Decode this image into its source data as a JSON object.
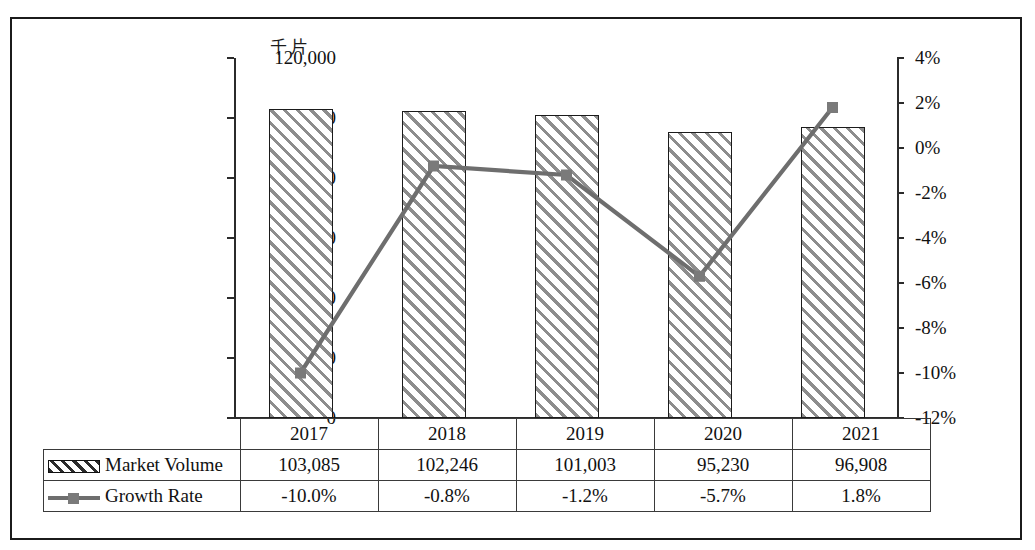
{
  "chart_data": {
    "type": "bar",
    "title": "",
    "subtitle": "",
    "unit_label": "千片",
    "categories": [
      "2017",
      "2018",
      "2019",
      "2020",
      "2021"
    ],
    "xlabel": "",
    "grid": false,
    "legend_position": "table-below",
    "series": [
      {
        "name": "Market Volume",
        "type": "bar",
        "axis": "left",
        "values": [
          103085,
          102246,
          101003,
          95230,
          96908
        ],
        "display_values": [
          "103,085",
          "102,246",
          "101,003",
          "95,230",
          "96,908"
        ],
        "swatch": "hatched-rectangle"
      },
      {
        "name": "Growth Rate",
        "type": "line",
        "axis": "right",
        "values": [
          -10.0,
          -0.8,
          -1.2,
          -5.7,
          1.8
        ],
        "display_values": [
          "-10.0%",
          "-0.8%",
          "-1.2%",
          "-5.7%",
          "1.8%"
        ],
        "swatch": "line-with-square-marker"
      }
    ],
    "left_axis": {
      "label": "",
      "ylim": [
        0,
        120000
      ],
      "tick_step": 20000,
      "ticks": [
        0,
        20000,
        40000,
        60000,
        80000,
        100000,
        120000
      ],
      "tick_labels": [
        "0",
        "20,000",
        "40,000",
        "60,000",
        "80,000",
        "100,000",
        "120,000"
      ]
    },
    "right_axis": {
      "label": "",
      "ylim": [
        -12,
        4
      ],
      "tick_step": 2,
      "ticks": [
        -12,
        -10,
        -8,
        -6,
        -4,
        -2,
        0,
        2,
        4
      ],
      "tick_labels": [
        "-12%",
        "-10%",
        "-8%",
        "-6%",
        "-4%",
        "-2%",
        "0%",
        "2%",
        "4%"
      ]
    },
    "colors": {
      "bar_outline": "#1b1b1b",
      "bar_hatch": "#8d8d8d",
      "line": "#6e6e6e",
      "marker": "#7a7a7a",
      "axis": "#2b2b2b",
      "frame": "#1b1b1b",
      "text": "#111111"
    }
  },
  "table": {
    "header_row": [
      "",
      "2017",
      "2018",
      "2019",
      "2020",
      "2021"
    ],
    "rows": [
      {
        "label": "Market Volume",
        "cells": [
          "103,085",
          "102,246",
          "101,003",
          "95,230",
          "96,908"
        ]
      },
      {
        "label": "Growth Rate",
        "cells": [
          "-10.0%",
          "-0.8%",
          "-1.2%",
          "-5.7%",
          "1.8%"
        ]
      }
    ]
  }
}
